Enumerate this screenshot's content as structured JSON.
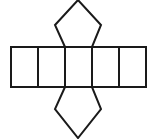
{
  "diagram": {
    "type": "geometric-net",
    "stroke_color": "#1a1a1a",
    "background": "#ffffff",
    "rect_strip": {
      "x": 11,
      "y": 47,
      "height": 40,
      "dividers_x": [
        11,
        38,
        65,
        92,
        119,
        146
      ]
    },
    "top_pentagon": {
      "points": [
        [
          65,
          47
        ],
        [
          55,
          25
        ],
        [
          78,
          0
        ],
        [
          101,
          25
        ],
        [
          92,
          47
        ]
      ]
    },
    "bottom_pentagon": {
      "points": [
        [
          65,
          87
        ],
        [
          55,
          109
        ],
        [
          78,
          138
        ],
        [
          101,
          109
        ],
        [
          92,
          87
        ]
      ]
    }
  }
}
